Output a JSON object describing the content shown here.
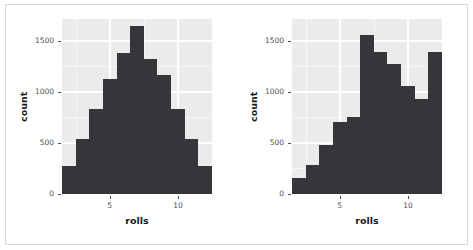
{
  "figure": {
    "width": 473,
    "height": 250,
    "background_color": "#ffffff",
    "frame_color": "#d9d9d9",
    "panel_color": "#ebebeb",
    "grid_color": "#ffffff",
    "bar_color": "#35353a",
    "axis_text_color": "#4d4d4d",
    "axis_title_color": "#1a1a1a"
  },
  "chart_data": [
    {
      "type": "bar",
      "name": "fair-dice-histogram",
      "title": "",
      "xlabel": "rolls",
      "ylabel": "count",
      "categories": [
        2,
        3,
        4,
        5,
        6,
        7,
        8,
        9,
        10,
        11,
        12
      ],
      "values": [
        275,
        545,
        840,
        1130,
        1390,
        1650,
        1330,
        1165,
        840,
        545,
        275
      ],
      "xlim": [
        1.5,
        12.5
      ],
      "ylim": [
        0,
        1720
      ],
      "xticks": [
        5,
        10
      ],
      "xtick_labels": [
        "5",
        "10"
      ],
      "yticks": [
        0,
        500,
        1000,
        1500
      ],
      "ytick_labels": [
        "0",
        "500",
        "1000",
        "1500"
      ],
      "grid": true,
      "legend": "none"
    },
    {
      "type": "bar",
      "name": "loaded-dice-histogram",
      "title": "",
      "xlabel": "rolls",
      "ylabel": "count",
      "categories": [
        2,
        3,
        4,
        5,
        6,
        7,
        8,
        9,
        10,
        11,
        12
      ],
      "values": [
        160,
        290,
        480,
        710,
        760,
        1560,
        1400,
        1280,
        1060,
        930,
        1400
      ],
      "xlim": [
        1.5,
        12.5
      ],
      "ylim": [
        0,
        1720
      ],
      "xticks": [
        5,
        10
      ],
      "xtick_labels": [
        "5",
        "10"
      ],
      "yticks": [
        0,
        500,
        1000,
        1500
      ],
      "ytick_labels": [
        "0",
        "500",
        "1000",
        "1500"
      ],
      "grid": true,
      "legend": "none"
    }
  ],
  "panels": [
    {
      "id": "left",
      "axis_title_x": "rolls",
      "axis_title_y": "count",
      "ytick_labels": [
        "1500",
        "1000",
        "500",
        "0"
      ],
      "xtick_labels": [
        "5",
        "10"
      ]
    },
    {
      "id": "right",
      "axis_title_x": "rolls",
      "axis_title_y": "count",
      "ytick_labels": [
        "1500",
        "1000",
        "500",
        "0"
      ],
      "xtick_labels": [
        "5",
        "10"
      ]
    }
  ]
}
